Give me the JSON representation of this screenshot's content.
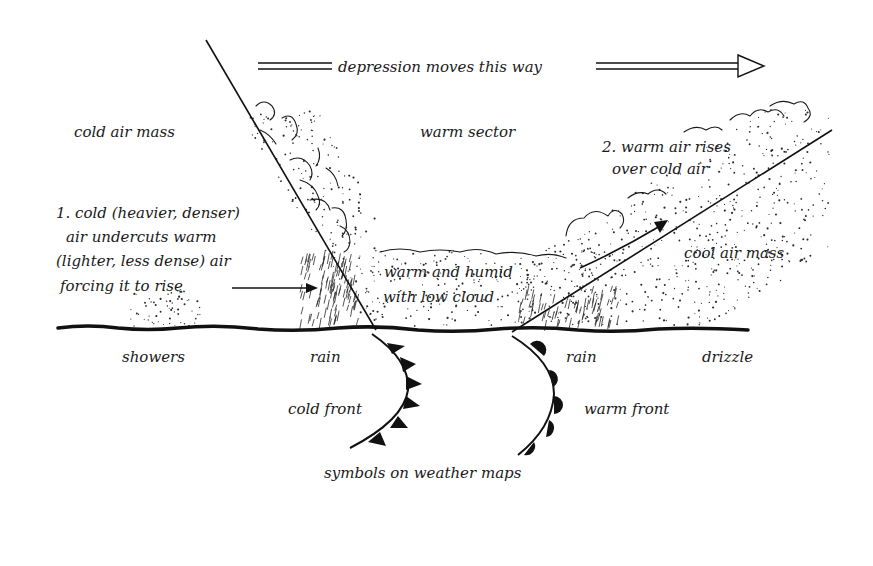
{
  "diagram": {
    "title": "depression moves this way",
    "colors": {
      "ink": "#1a1a1a",
      "paper": "#ffffff"
    },
    "regions": {
      "cold_air_mass": "cold air mass",
      "warm_sector": "warm sector",
      "cool_air_mass": "cool air mass"
    },
    "annotations": {
      "cold_undercut": [
        "1. cold (heavier, denser)",
        "air undercuts warm",
        "(lighter, less dense) air",
        "forcing it to rise"
      ],
      "warm_rises": [
        "2. warm air rises",
        "over cold air"
      ],
      "warm_humid": [
        "warm and humid",
        "with low cloud"
      ]
    },
    "weather": {
      "showers": "showers",
      "rain_cold": "rain",
      "rain_warm": "rain",
      "drizzle": "drizzle"
    },
    "fronts": {
      "cold_front": "cold front",
      "warm_front": "warm front",
      "caption": "symbols on weather maps"
    }
  }
}
